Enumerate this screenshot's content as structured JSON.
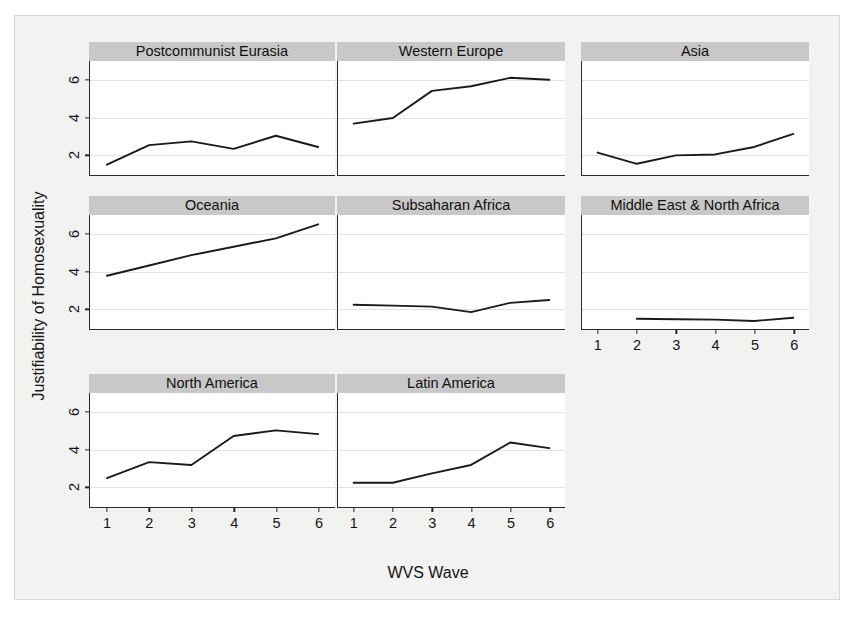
{
  "chart_data": {
    "type": "line",
    "title": "",
    "xlabel": "WVS Wave",
    "ylabel": "Justifiability of Homosexuality",
    "x": [
      1,
      2,
      3,
      4,
      5,
      6
    ],
    "xticklabels": [
      "1",
      "2",
      "3",
      "4",
      "5",
      "6"
    ],
    "yticks": [
      2,
      4,
      6
    ],
    "yticklabels": [
      "2",
      "4",
      "6"
    ],
    "xlim": [
      0.6,
      6.4
    ],
    "ylim": [
      0.9,
      7.0
    ],
    "grid": "horizontal",
    "legend": "none",
    "line_color": "#1a1a1a",
    "panel_header_color": "#c8c8c8",
    "layout": "3x3 small-multiples grid (8 panels, last cell empty)",
    "panels": [
      {
        "name": "postcommunist-eurasia",
        "title": "Postcommunist Eurasia",
        "row": 0,
        "col": 0,
        "x": [
          1,
          2,
          3,
          4,
          5,
          6
        ],
        "values": [
          1.45,
          2.5,
          2.7,
          2.3,
          3.0,
          2.4
        ],
        "show_xaxis": false
      },
      {
        "name": "western-europe",
        "title": "Western Europe",
        "row": 0,
        "col": 1,
        "x": [
          1,
          2,
          3,
          4,
          5,
          6
        ],
        "values": [
          3.65,
          3.95,
          5.4,
          5.65,
          6.1,
          6.0
        ],
        "show_xaxis": false
      },
      {
        "name": "asia",
        "title": "Asia",
        "row": 0,
        "col": 2,
        "x": [
          1,
          2,
          3,
          4,
          5,
          6
        ],
        "values": [
          2.1,
          1.5,
          1.95,
          2.0,
          2.4,
          3.1
        ],
        "show_xaxis": false
      },
      {
        "name": "oceania",
        "title": "Oceania",
        "row": 1,
        "col": 0,
        "x": [
          1,
          2,
          3,
          4,
          5,
          6
        ],
        "values": [
          3.75,
          4.3,
          4.85,
          5.3,
          5.75,
          6.5
        ],
        "show_xaxis": false
      },
      {
        "name": "subsaharan-africa",
        "title": "Subsaharan Africa",
        "row": 1,
        "col": 1,
        "x": [
          1,
          2,
          3,
          4,
          5,
          6
        ],
        "values": [
          2.2,
          2.15,
          2.1,
          1.8,
          2.3,
          2.45
        ],
        "show_xaxis": false
      },
      {
        "name": "middle-east-north-africa",
        "title": "Middle East & North Africa",
        "row": 1,
        "col": 2,
        "x": [
          2,
          3,
          4,
          5,
          6
        ],
        "values": [
          1.45,
          1.42,
          1.4,
          1.33,
          1.5
        ],
        "show_xaxis": true
      },
      {
        "name": "north-america",
        "title": "North America",
        "row": 2,
        "col": 0,
        "x": [
          1,
          2,
          3,
          4,
          5,
          6
        ],
        "values": [
          2.45,
          3.3,
          3.15,
          4.7,
          5.0,
          4.8
        ],
        "show_xaxis": true
      },
      {
        "name": "latin-america",
        "title": "Latin America",
        "row": 2,
        "col": 1,
        "x": [
          1,
          2,
          3,
          4,
          5,
          6
        ],
        "values": [
          2.2,
          2.2,
          2.7,
          3.15,
          4.35,
          4.05
        ],
        "show_xaxis": true
      }
    ]
  }
}
